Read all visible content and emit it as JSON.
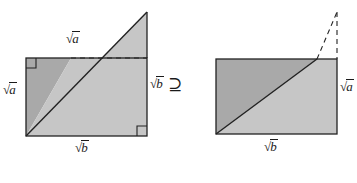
{
  "figure": {
    "name": "sqrt-area-inequality-diagram",
    "relation_symbol": "⊇",
    "colors": {
      "stroke": "#222222",
      "dark_fill": "#a9a9a9",
      "light_fill": "#c6c6c6",
      "background": "#ffffff",
      "dashed_stroke": "#222222",
      "label_color": "#1a1a1a"
    },
    "left_figure": {
      "name": "left-composite-figure",
      "rect": {
        "x": 26,
        "y": 58,
        "width": 121,
        "height": 78
      },
      "apex": {
        "x": 147,
        "y": 12
      },
      "diagonal_from": {
        "x": 26,
        "y": 136
      },
      "diagonal_to": {
        "x": 147,
        "y": 12
      },
      "dashed_line": {
        "x1": 71,
        "y1": 58,
        "x2": 147,
        "y2": 58
      },
      "right_angle_markers": [
        {
          "corner": "top-left",
          "x": 26,
          "y": 58
        },
        {
          "corner": "bottom-right",
          "x": 147,
          "y": 136
        }
      ],
      "labels": [
        {
          "name": "label-top-sqrt-a",
          "radical": "√",
          "radicand": "a",
          "x": 72,
          "y": 36
        },
        {
          "name": "label-left-sqrt-a",
          "radical": "√",
          "radicand": "a",
          "x": 4,
          "y": 88
        },
        {
          "name": "label-right-sqrt-b",
          "radical": "√",
          "radicand": "b",
          "x": 150,
          "y": 81
        },
        {
          "name": "label-bottom-sqrt-b",
          "radical": "√",
          "radicand": "b",
          "x": 77,
          "y": 143
        }
      ]
    },
    "right_figure": {
      "name": "right-rectangle-figure",
      "rect": {
        "x": 216,
        "y": 59,
        "width": 121,
        "height": 75
      },
      "apex": {
        "x": 337,
        "y": 12
      },
      "diagonal_from": {
        "x": 216,
        "y": 134
      },
      "diagonal_to": {
        "x": 317,
        "y": 59
      },
      "dashed_diagonal": {
        "x1": 317,
        "y1": 59,
        "x2": 337,
        "y2": 12
      },
      "dashed_vertical": {
        "x1": 337,
        "y1": 12,
        "x2": 337,
        "y2": 59
      },
      "labels": [
        {
          "name": "label-right-sqrt-a",
          "radical": "√",
          "radicand": "a",
          "x": 340,
          "y": 84
        },
        {
          "name": "label-bottom-sqrt-b",
          "radical": "√",
          "radicand": "b",
          "x": 266,
          "y": 142
        }
      ]
    },
    "relation": {
      "name": "superset-or-equal-symbol",
      "text": "⊇",
      "x": 168,
      "y": 78
    }
  }
}
